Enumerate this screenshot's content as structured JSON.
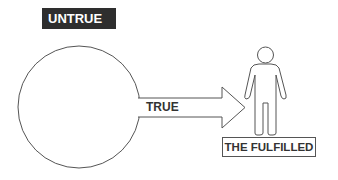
{
  "diagram": {
    "labels": {
      "untrue": "UNTRUE",
      "true": "TRUE",
      "fulfilled": "THE FULFILLED"
    },
    "shapes": {
      "circle": "large-circle",
      "arrow": "right-arrow",
      "figure": "person-figure"
    },
    "colors": {
      "stroke": "#555555",
      "label_bg": "#2e2e2e",
      "label_text": "#ffffff",
      "text": "#333333"
    }
  }
}
